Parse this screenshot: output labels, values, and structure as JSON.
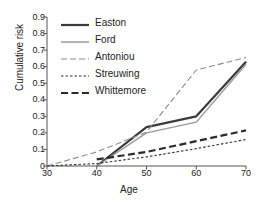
{
  "chart_data": {
    "type": "line",
    "title": "",
    "xlabel": "Age",
    "ylabel": "Cumulative risk",
    "xlim": [
      30,
      70
    ],
    "ylim": [
      0,
      0.9
    ],
    "xticks": [
      "30",
      "40",
      "50",
      "60",
      "70"
    ],
    "yticks": [
      "0",
      "0.1",
      "0.2",
      "0.3",
      "0.4",
      "0.5",
      "0.6",
      "0.7",
      "0.8",
      "0.9"
    ],
    "grid": false,
    "legend_position": "top-left-inside",
    "series": [
      {
        "name": "Easton",
        "style": "solid",
        "color": "#3a3a3a",
        "width": 2.2,
        "x": [
          40,
          50,
          60,
          70
        ],
        "y": [
          0.0,
          0.235,
          0.3,
          0.63
        ]
      },
      {
        "name": "Ford",
        "style": "solid",
        "color": "#9a9a9a",
        "width": 1.5,
        "x": [
          40,
          50,
          60,
          70
        ],
        "y": [
          0.0,
          0.2,
          0.265,
          0.615
        ]
      },
      {
        "name": "Antoniou",
        "style": "dashed",
        "color": "#8c8c8c",
        "width": 1.1,
        "x": [
          30,
          40,
          50,
          60,
          70
        ],
        "y": [
          0.0,
          0.085,
          0.205,
          0.58,
          0.655
        ]
      },
      {
        "name": "Streuwing",
        "style": "dotted",
        "color": "#333333",
        "width": 1.1,
        "x": [
          30,
          40,
          50,
          60,
          70
        ],
        "y": [
          0.0,
          0.015,
          0.055,
          0.105,
          0.16
        ]
      },
      {
        "name": "Whittemore",
        "style": "dashed-thick",
        "color": "#2a2a2a",
        "width": 2.2,
        "x": [
          40,
          50,
          60,
          70
        ],
        "y": [
          0.04,
          0.085,
          0.15,
          0.215
        ]
      }
    ]
  },
  "legend": {
    "items": [
      {
        "label": "Easton"
      },
      {
        "label": "Ford"
      },
      {
        "label": "Antoniou"
      },
      {
        "label": "Streuwing"
      },
      {
        "label": "Whittemore"
      }
    ]
  }
}
